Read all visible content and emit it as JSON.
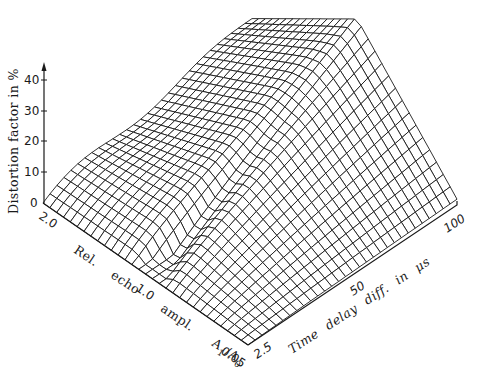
{
  "chart_data": {
    "type": "surface3d",
    "title": "",
    "zlabel": "Distortion factor in %",
    "xlabel": "Time delay diff. in μs",
    "ylabel": "Rel. echo ampl. A1/A0",
    "zlim": [
      0,
      40
    ],
    "z_ticks": [
      "0",
      "10",
      "20",
      "30",
      "40"
    ],
    "x_ticks": [
      "2.5",
      "50",
      "100"
    ],
    "x_range": [
      2.5,
      100
    ],
    "y_ticks": [
      "0.05",
      "1.0",
      "2.0"
    ],
    "y_range": [
      0.05,
      2.0
    ],
    "grid": {
      "nx": 30,
      "ny": 30
    },
    "sample_points": [
      {
        "time_delay_us": 2.5,
        "echo_ampl": 0.05,
        "distortion_pct": 0
      },
      {
        "time_delay_us": 100,
        "echo_ampl": 0.05,
        "distortion_pct": 1
      },
      {
        "time_delay_us": 2.5,
        "echo_ampl": 2.0,
        "distortion_pct": 0
      },
      {
        "time_delay_us": 50,
        "echo_ampl": 1.0,
        "distortion_pct": 22
      },
      {
        "time_delay_us": 100,
        "echo_ampl": 1.0,
        "distortion_pct": 37
      },
      {
        "time_delay_us": 100,
        "echo_ampl": 2.0,
        "distortion_pct": 15
      }
    ]
  },
  "axes": {
    "z_title": "Distortion factor in %",
    "x_title": "Time delay diff. in μs",
    "y_title_parts": [
      "Rel.",
      "echo",
      "ampl.",
      "A",
      "1",
      "/A",
      "0"
    ],
    "x_tick_labels": [
      "2.5",
      "50",
      "100"
    ],
    "y_tick_labels": [
      "0.05",
      "1.0",
      "2.0"
    ],
    "z_tick_labels": [
      "0",
      "10",
      "20",
      "30",
      "40"
    ]
  },
  "style": {
    "line_color": "#1a1a1a",
    "fill_color": "#ffffff"
  }
}
